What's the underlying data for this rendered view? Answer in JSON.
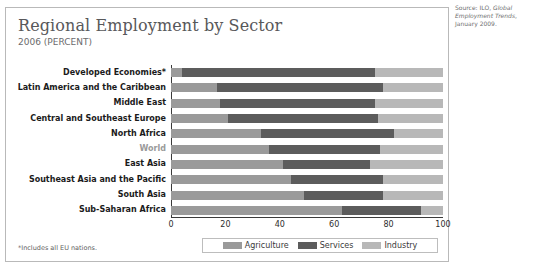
{
  "source_note": {
    "prefix": "Source: ILO, ",
    "italic": "Global Employment Trends",
    "suffix": ", January 2009."
  },
  "chart_data": {
    "type": "bar",
    "orientation": "horizontal",
    "stacked": true,
    "title": "Regional Employment by Sector",
    "subtitle": "2006 (PERCENT)",
    "xlabel": "",
    "ylabel": "",
    "xlim": [
      0,
      100
    ],
    "xticks": [
      0,
      20,
      40,
      60,
      80,
      100
    ],
    "grid": false,
    "legend_position": "bottom",
    "footnote": "*Includes all EU nations.",
    "categories": [
      "Developed Economies*",
      "Latin America and the Caribbean",
      "Middle East",
      "Central and Southeast Europe",
      "North Africa",
      "World",
      "East Asia",
      "Southeast Asia and the Pacific",
      "South Asia",
      "Sub-Saharan Africa"
    ],
    "highlight_category": "World",
    "series": [
      {
        "name": "Agriculture",
        "color": "#9a9a9a",
        "values": [
          4,
          17,
          18,
          21,
          33,
          36,
          41,
          44,
          49,
          63
        ]
      },
      {
        "name": "Services",
        "color": "#5c5c5c",
        "values": [
          71,
          61,
          57,
          55,
          49,
          41,
          32,
          34,
          29,
          29
        ]
      },
      {
        "name": "Industry",
        "color": "#b8b8b8",
        "values": [
          25,
          22,
          25,
          24,
          18,
          23,
          27,
          22,
          22,
          8
        ]
      }
    ]
  }
}
